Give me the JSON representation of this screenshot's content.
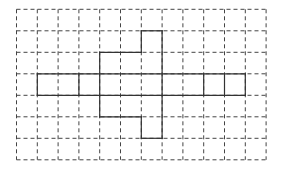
{
  "diagram": {
    "type": "grid-net",
    "grid": {
      "columns": 12,
      "rows": 7,
      "origin_x": 16.5,
      "origin_y": 9.3,
      "cell_width": 20.8,
      "cell_height": 21.5,
      "line_color": "#444444",
      "line_style": "dashed"
    },
    "shape": {
      "line_color": "#333333",
      "line_style": "solid",
      "segments": [
        {
          "orientation": "h",
          "row": 3,
          "from": 1,
          "to": 11
        },
        {
          "orientation": "h",
          "row": 4,
          "from": 1,
          "to": 11
        },
        {
          "orientation": "v",
          "col": 1,
          "from": 3,
          "to": 4
        },
        {
          "orientation": "v",
          "col": 3,
          "from": 3,
          "to": 4
        },
        {
          "orientation": "v",
          "col": 4,
          "from": 2,
          "to": 5
        },
        {
          "orientation": "v",
          "col": 7,
          "from": 1,
          "to": 6
        },
        {
          "orientation": "v",
          "col": 9,
          "from": 3,
          "to": 4
        },
        {
          "orientation": "v",
          "col": 10,
          "from": 3,
          "to": 4
        },
        {
          "orientation": "v",
          "col": 11,
          "from": 3,
          "to": 4
        },
        {
          "orientation": "h",
          "row": 1,
          "from": 6,
          "to": 7
        },
        {
          "orientation": "v",
          "col": 6,
          "from": 1,
          "to": 2
        },
        {
          "orientation": "h",
          "row": 2,
          "from": 4,
          "to": 6
        },
        {
          "orientation": "h",
          "row": 5,
          "from": 4,
          "to": 6
        },
        {
          "orientation": "v",
          "col": 6,
          "from": 5,
          "to": 6
        },
        {
          "orientation": "h",
          "row": 6,
          "from": 6,
          "to": 7
        }
      ]
    }
  }
}
